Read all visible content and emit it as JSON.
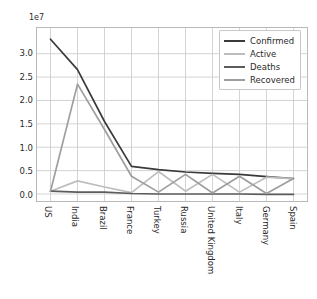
{
  "chart_data": {
    "type": "line",
    "title": "",
    "xlabel": "",
    "ylabel": "",
    "offset_text": "1e7",
    "y_scale": 10000000,
    "grid": true,
    "legend_position": "upper right",
    "ylim": [
      -0.15,
      3.55
    ],
    "ytick_labels": [
      "0.0",
      "0.5",
      "1.0",
      "1.5",
      "2.0",
      "2.5",
      "3.0"
    ],
    "ytick_values": [
      0.0,
      0.5,
      1.0,
      1.5,
      2.0,
      2.5,
      3.0
    ],
    "categories": [
      "US",
      "India",
      "Brazil",
      "France",
      "Turkey",
      "Russia",
      "United Kingdom",
      "Italy",
      "Germany",
      "Spain"
    ],
    "series": [
      {
        "name": "Confirmed",
        "color": "#3a3a3a",
        "values": [
          3.31,
          2.66,
          1.55,
          0.59,
          0.52,
          0.47,
          0.44,
          0.42,
          0.37,
          0.33
        ]
      },
      {
        "name": "Active",
        "color": "#bdbdbd",
        "values": [
          0.06,
          0.28,
          0.15,
          0.03,
          0.48,
          0.06,
          0.42,
          0.04,
          0.36,
          0.33
        ]
      },
      {
        "name": "Deaths",
        "color": "#5c5c5c",
        "values": [
          0.06,
          0.04,
          0.04,
          0.01,
          0.0,
          0.0,
          0.0,
          0.0,
          -0.01,
          -0.01
        ]
      },
      {
        "name": "Recovered",
        "color": "#9e9e9e",
        "values": [
          0.06,
          2.35,
          1.38,
          0.38,
          0.04,
          0.42,
          0.02,
          0.38,
          0.01,
          0.33
        ]
      }
    ]
  },
  "legend": {
    "items": [
      {
        "label": "Confirmed",
        "color": "#3a3a3a"
      },
      {
        "label": "Active",
        "color": "#bdbdbd"
      },
      {
        "label": "Deaths",
        "color": "#5c5c5c"
      },
      {
        "label": "Recovered",
        "color": "#9e9e9e"
      }
    ]
  },
  "axis": {
    "offset_text": "1e7"
  },
  "style": {
    "grid_color": "#c9c9c9",
    "frame_color": "#b9b9b9",
    "text_color": "#2b2b2b",
    "background": "#ffffff"
  }
}
